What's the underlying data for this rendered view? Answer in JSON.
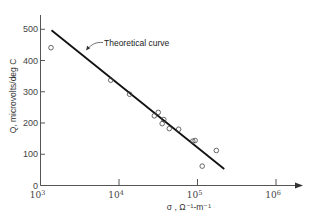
{
  "chart_data": {
    "type": "scatter",
    "title": "",
    "xlabel": "σ , Ω⁻¹-m⁻¹",
    "ylabel": "Q, microvolts/deg C",
    "xscale": "log",
    "xlim": [
      1000,
      2000000
    ],
    "ylim": [
      0,
      560
    ],
    "x_ticks": [
      {
        "value": 1000,
        "label_base": "10",
        "label_exp": "3"
      },
      {
        "value": 10000,
        "label_base": "10",
        "label_exp": "4"
      },
      {
        "value": 100000,
        "label_base": "10",
        "label_exp": "5"
      },
      {
        "value": 1000000,
        "label_base": "10",
        "label_exp": "6"
      }
    ],
    "y_ticks": [
      0,
      100,
      200,
      300,
      400,
      500
    ],
    "grid": false,
    "legend": null,
    "series": [
      {
        "name": "Measured",
        "type": "scatter",
        "marker": "open-circle",
        "points": [
          {
            "x": 1360,
            "y": 441
          },
          {
            "x": 7850,
            "y": 337
          },
          {
            "x": 13650,
            "y": 292
          },
          {
            "x": 28200,
            "y": 223
          },
          {
            "x": 31600,
            "y": 234
          },
          {
            "x": 35500,
            "y": 198
          },
          {
            "x": 37200,
            "y": 211
          },
          {
            "x": 43700,
            "y": 182
          },
          {
            "x": 57500,
            "y": 180
          },
          {
            "x": 87100,
            "y": 142
          },
          {
            "x": 93300,
            "y": 144
          },
          {
            "x": 114800,
            "y": 62
          },
          {
            "x": 173800,
            "y": 112
          }
        ]
      },
      {
        "name": "Theoretical curve",
        "type": "line",
        "points": [
          {
            "x": 1380,
            "y": 497
          },
          {
            "x": 219000,
            "y": 53
          }
        ]
      }
    ],
    "annotations": [
      {
        "text": "Theoretical curve",
        "arrow_to": {
          "x": 7000,
          "y": 425
        }
      }
    ]
  }
}
